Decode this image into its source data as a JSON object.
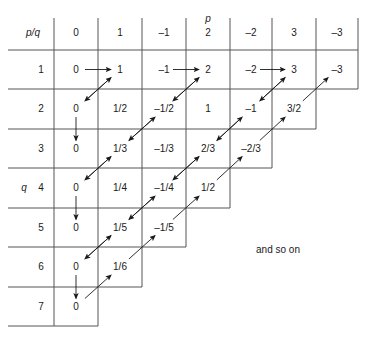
{
  "figure": {
    "type": "rational-enumeration-grid",
    "corner_label": "p/q",
    "axis_labels": {
      "columns": "p",
      "rows": "q"
    },
    "note": "and so on",
    "line_color": "#555555",
    "text_color": "#1a1a1a",
    "arrow_color": "#1a1a1a"
  },
  "columns": {
    "header": [
      "0",
      "1",
      "-1",
      "2",
      "-2",
      "3",
      "-3"
    ],
    "values": [
      0,
      1,
      -1,
      2,
      -2,
      3,
      -3
    ],
    "x_lines": [
      54,
      98,
      142,
      186,
      230,
      272,
      316,
      358
    ]
  },
  "rows": {
    "header": [
      "1",
      "2",
      "3",
      "4",
      "5",
      "6",
      "7"
    ],
    "values": [
      1,
      2,
      3,
      4,
      5,
      6,
      7
    ],
    "y_lines": [
      50,
      89,
      129,
      168,
      208,
      247,
      287,
      326
    ],
    "cells_per_row": [
      7,
      6,
      5,
      4,
      3,
      2,
      1
    ]
  },
  "grid": [
    {
      "q": "1",
      "cells": [
        "0",
        "1",
        "–1",
        "2",
        "–2",
        "3",
        "–3"
      ]
    },
    {
      "q": "2",
      "cells": [
        "0",
        "1/2",
        "–1/2",
        "1",
        "–1",
        "3/2"
      ]
    },
    {
      "q": "3",
      "cells": [
        "0",
        "1/3",
        "–1/3",
        "2/3",
        "–2/3"
      ]
    },
    {
      "q": "4",
      "cells": [
        "0",
        "1/4",
        "–1/4",
        "1/2"
      ]
    },
    {
      "q": "5",
      "cells": [
        "0",
        "1/5",
        "–1/5"
      ]
    },
    {
      "q": "6",
      "cells": [
        "0",
        "1/6"
      ]
    },
    {
      "q": "7",
      "cells": [
        "0"
      ]
    }
  ],
  "arrows": {
    "horizontal_right": [
      {
        "row": 1,
        "from_col": 0,
        "to_col": 1
      },
      {
        "row": 1,
        "from_col": 2,
        "to_col": 3
      },
      {
        "row": 1,
        "from_col": 4,
        "to_col": 5
      }
    ],
    "vertical_down": [
      {
        "col": 0,
        "from_row": 2,
        "to_row": 3
      },
      {
        "col": 0,
        "from_row": 4,
        "to_row": 5
      },
      {
        "col": 0,
        "from_row": 6,
        "to_row": 7
      }
    ],
    "diagonal_down_left": [
      {
        "from": {
          "row": 1,
          "col": 1
        },
        "to": {
          "row": 2,
          "col": 0
        }
      },
      {
        "from": {
          "row": 1,
          "col": 3
        },
        "to": {
          "row": 2,
          "col": 2
        }
      },
      {
        "from": {
          "row": 1,
          "col": 5
        },
        "to": {
          "row": 2,
          "col": 4
        }
      },
      {
        "from": {
          "row": 2,
          "col": 2
        },
        "to": {
          "row": 3,
          "col": 1
        }
      },
      {
        "from": {
          "row": 2,
          "col": 4
        },
        "to": {
          "row": 3,
          "col": 3
        }
      },
      {
        "from": {
          "row": 3,
          "col": 1
        },
        "to": {
          "row": 4,
          "col": 0
        }
      },
      {
        "from": {
          "row": 3,
          "col": 3
        },
        "to": {
          "row": 4,
          "col": 2
        }
      },
      {
        "from": {
          "row": 4,
          "col": 2
        },
        "to": {
          "row": 5,
          "col": 1
        }
      },
      {
        "from": {
          "row": 5,
          "col": 1
        },
        "to": {
          "row": 6,
          "col": 0
        }
      }
    ],
    "diagonal_up_right": [
      {
        "from": {
          "row": 2,
          "col": 0
        },
        "to": {
          "row": 1,
          "col": 1
        }
      },
      {
        "from": {
          "row": 2,
          "col": 2
        },
        "to": {
          "row": 1,
          "col": 3
        }
      },
      {
        "from": {
          "row": 2,
          "col": 4
        },
        "to": {
          "row": 1,
          "col": 5
        }
      },
      {
        "from": {
          "row": 2,
          "col": 5
        },
        "to": {
          "row": 1,
          "col": 6
        }
      },
      {
        "from": {
          "row": 3,
          "col": 1
        },
        "to": {
          "row": 2,
          "col": 2
        }
      },
      {
        "from": {
          "row": 3,
          "col": 3
        },
        "to": {
          "row": 2,
          "col": 4
        }
      },
      {
        "from": {
          "row": 3,
          "col": 4
        },
        "to": {
          "row": 2,
          "col": 5
        }
      },
      {
        "from": {
          "row": 4,
          "col": 0
        },
        "to": {
          "row": 3,
          "col": 1
        }
      },
      {
        "from": {
          "row": 4,
          "col": 2
        },
        "to": {
          "row": 3,
          "col": 3
        }
      },
      {
        "from": {
          "row": 4,
          "col": 3
        },
        "to": {
          "row": 3,
          "col": 4
        }
      },
      {
        "from": {
          "row": 5,
          "col": 1
        },
        "to": {
          "row": 4,
          "col": 2
        }
      },
      {
        "from": {
          "row": 5,
          "col": 2
        },
        "to": {
          "row": 4,
          "col": 3
        }
      },
      {
        "from": {
          "row": 6,
          "col": 0
        },
        "to": {
          "row": 5,
          "col": 1
        }
      },
      {
        "from": {
          "row": 6,
          "col": 1
        },
        "to": {
          "row": 5,
          "col": 2
        }
      },
      {
        "from": {
          "row": 7,
          "col": 0
        },
        "to": {
          "row": 6,
          "col": 1
        }
      }
    ]
  }
}
